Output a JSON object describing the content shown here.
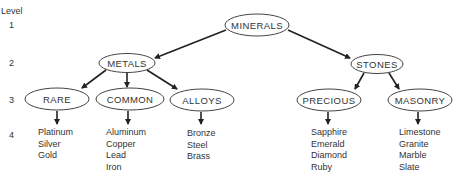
{
  "levels": {
    "title": "Level",
    "items": [
      "1",
      "2",
      "3",
      "4"
    ]
  },
  "nodes": {
    "minerals": "MINERALS",
    "metals": "METALS",
    "stones": "STONES",
    "rare": "RARE",
    "common": "COMMON",
    "alloys": "ALLOYS",
    "precious": "PRECIOUS",
    "masonry": "MASONRY"
  },
  "leaves": {
    "rare": [
      "Platinum",
      "Silver",
      "Gold"
    ],
    "common": [
      "Aluminum",
      "Copper",
      "Lead",
      "Iron"
    ],
    "alloys": [
      "Bronze",
      "Steel",
      "Brass"
    ],
    "precious": [
      "Sapphire",
      "Emerald",
      "Diamond",
      "Ruby"
    ],
    "masonry": [
      "Limestone",
      "Granite",
      "Marble",
      "Slate"
    ]
  }
}
